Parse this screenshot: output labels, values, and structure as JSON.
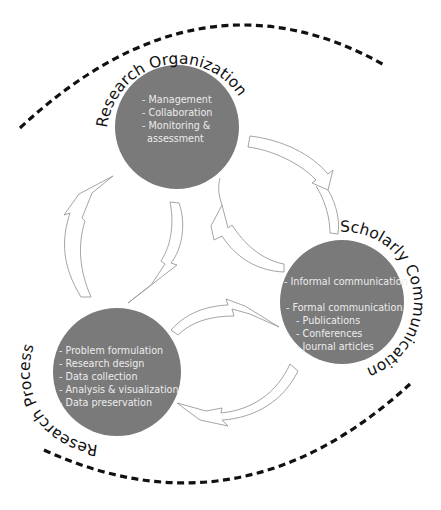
{
  "diagram": {
    "outer_arcs": [
      {
        "name": "top-dashed-arc",
        "style": "dashed"
      },
      {
        "name": "bottom-dashed-arc",
        "style": "dashed"
      }
    ],
    "nodes": [
      {
        "id": "research-organization",
        "title": "Research Organization",
        "items": [
          "- Management",
          "- Collaboration",
          "- Monitoring &",
          "  assessment"
        ]
      },
      {
        "id": "scholarly-communication",
        "title": "Scholarly Communication",
        "items": [
          "- Informal communication",
          "",
          "- Formal communication",
          "   - Publications",
          "   - Conferences",
          "   - Journal articles"
        ]
      },
      {
        "id": "research-process",
        "title": "Research Process",
        "items": [
          "- Problem formulation",
          "- Research design",
          "- Data collection",
          "- Analysis & visualization",
          "- Data preservation"
        ]
      }
    ],
    "arrows": [
      {
        "from": "research-organization",
        "to": "scholarly-communication"
      },
      {
        "from": "scholarly-communication",
        "to": "research-organization"
      },
      {
        "from": "research-organization",
        "to": "research-process"
      },
      {
        "from": "research-process",
        "to": "research-organization"
      },
      {
        "from": "research-process",
        "to": "scholarly-communication"
      },
      {
        "from": "scholarly-communication",
        "to": "research-process"
      }
    ],
    "colors": {
      "circle_fill": "#7a7a7a",
      "circle_text": "#ececec",
      "label_text": "#111111",
      "dashed_arc": "#111111",
      "arrow_outline": "#9a9a9a"
    }
  }
}
